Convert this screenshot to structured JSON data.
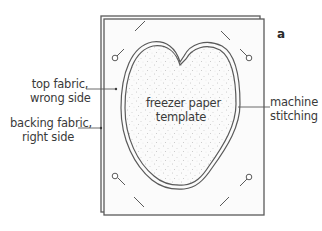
{
  "figure": {
    "letter": "a",
    "colors": {
      "outline": "#5a5a5a",
      "stitch": "#6a6a6a",
      "dots": "#9a9a9a",
      "text": "#3a3a3a",
      "background": "#ffffff",
      "fabric_fill": "#fbfbfb"
    }
  },
  "labels": {
    "top_fabric": {
      "line1": "top fabric,",
      "line2": "wrong side"
    },
    "backing_fabric": {
      "line1": "backing fabric,",
      "line2": "right side"
    },
    "template": {
      "line1": "freezer paper",
      "line2": "template"
    },
    "stitching": {
      "line1": "machine",
      "line2": "stitching"
    }
  },
  "pins": [
    {
      "corner": "top-left"
    },
    {
      "corner": "top-right"
    },
    {
      "corner": "bottom-left"
    },
    {
      "corner": "bottom-right"
    }
  ]
}
